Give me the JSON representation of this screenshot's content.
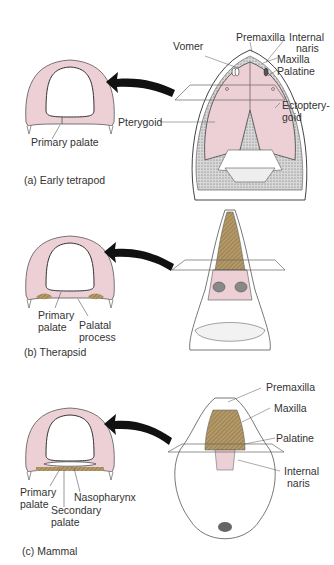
{
  "panels": [
    {
      "caption": "(a) Early tetrapod",
      "palate_labels": [
        "Primary palate"
      ],
      "skull_labels": [
        "Vomer",
        "Premaxilla",
        "Internal",
        "naris",
        "Maxilla",
        "Palatine",
        "Ectoptery-",
        "goid",
        "Pterygoid"
      ]
    },
    {
      "caption": "(b) Therapsid",
      "palate_labels": [
        "Primary",
        "palate",
        "Palatal",
        "process"
      ]
    },
    {
      "caption": "(c) Mammal",
      "palate_labels": [
        "Primary",
        "palate",
        "Secondary",
        "palate",
        "Nasopharynx"
      ],
      "skull_labels": [
        "Premaxilla",
        "Maxilla",
        "Palatine",
        "Internal",
        "naris"
      ]
    }
  ],
  "colors": {
    "palate_pink": "#ecd0d5",
    "secondary_palate_brown": "#b59a68",
    "arrow": "#111111",
    "bone_gray": "#9a9a9a"
  }
}
